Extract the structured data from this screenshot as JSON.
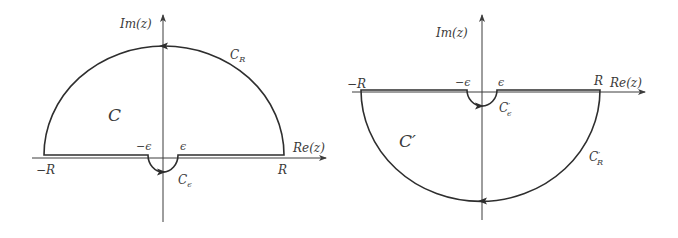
{
  "figure": {
    "background": "#ffffff",
    "stroke_color": "#2e2e2e",
    "left_panel": {
      "axis_labels": {
        "x": "Re(z)",
        "y": "Im(z)"
      },
      "tick_labels": {
        "neg_R": "−R",
        "pos_R": "R",
        "neg_eps": "−ϵ",
        "pos_eps": "ϵ"
      },
      "region_label": "C",
      "large_arc_label": {
        "base": "C",
        "sub": "R"
      },
      "small_arc_label": {
        "base": "C",
        "sub": "ϵ"
      },
      "large_arc_side": "upper half-plane",
      "small_arc_side": "below real axis",
      "large_arc_direction": "counter-clockwise (arrow pointing left at top)",
      "small_arc_direction": "arrow pointing right at bottom"
    },
    "right_panel": {
      "axis_labels": {
        "x": "Re(z)",
        "y": "Im(z)"
      },
      "tick_labels": {
        "neg_R": "−R",
        "pos_R": "R",
        "neg_eps": "−ϵ",
        "pos_eps": "ϵ"
      },
      "region_label": "C′",
      "large_arc_label": {
        "base": "C",
        "prime": "′",
        "sub": "R"
      },
      "small_arc_label": {
        "base": "C",
        "prime": "′",
        "sub": "ϵ"
      },
      "large_arc_side": "lower half-plane",
      "small_arc_side": "below real axis",
      "large_arc_direction": "arrow pointing left at bottom",
      "small_arc_direction": "arrow pointing right at bottom"
    }
  }
}
